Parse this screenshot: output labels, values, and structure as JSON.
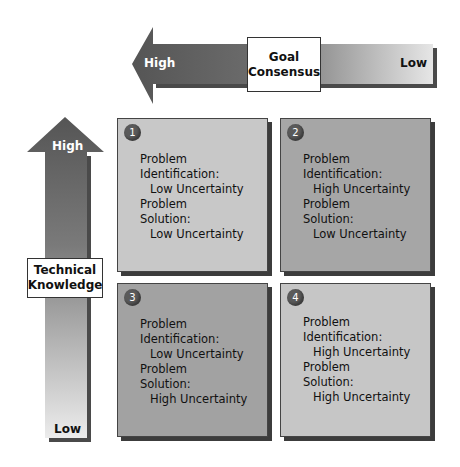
{
  "axes": {
    "horizontal": {
      "title_line1": "Goal",
      "title_line2": "Consensus",
      "left_label": "High",
      "right_label": "Low"
    },
    "vertical": {
      "title_line1": "Technical",
      "title_line2": "Knowledge",
      "top_label": "High",
      "bottom_label": "Low"
    }
  },
  "quadrants": [
    {
      "number": "1",
      "id_label": "Problem",
      "id_label2": "Identification:",
      "id_value": "Low Uncertainty",
      "sol_label": "Problem",
      "sol_label2": "Solution:",
      "sol_value": "Low Uncertainty",
      "color": "#c8c8c8"
    },
    {
      "number": "2",
      "id_label": "Problem",
      "id_label2": "Identification:",
      "id_value": "High Uncertainty",
      "sol_label": "Problem",
      "sol_label2": "Solution:",
      "sol_value": "Low Uncertainty",
      "color": "#a6a6a6"
    },
    {
      "number": "3",
      "id_label": "Problem",
      "id_label2": "Identification:",
      "id_value": "Low Uncertainty",
      "sol_label": "Problem",
      "sol_label2": "Solution:",
      "sol_value": "High Uncertainty",
      "color": "#a2a2a2"
    },
    {
      "number": "4",
      "id_label": "Problem",
      "id_label2": "Identification:",
      "id_value": "High Uncertainty",
      "sol_label": "Problem",
      "sol_label2": "Solution:",
      "sol_value": "High Uncertainty",
      "color": "#c6c6c6"
    }
  ]
}
